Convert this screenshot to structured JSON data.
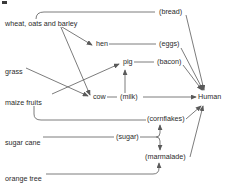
{
  "diagram": {
    "corner_mark": "page-corner-mark",
    "nodes": [
      {
        "id": "wheat",
        "label": "wheat, oats and barley",
        "x": 4,
        "y": 20,
        "kind": "source"
      },
      {
        "id": "grass",
        "label": "grass",
        "x": 4,
        "y": 68,
        "kind": "source"
      },
      {
        "id": "maize",
        "label": "maize fruits",
        "x": 4,
        "y": 99,
        "kind": "source"
      },
      {
        "id": "sugarcane",
        "label": "sugar cane",
        "x": 4,
        "y": 139,
        "kind": "source"
      },
      {
        "id": "orangetree",
        "label": "orange tree",
        "x": 4,
        "y": 175,
        "kind": "source"
      },
      {
        "id": "hen",
        "label": "hen",
        "x": 95,
        "y": 45,
        "kind": "animal"
      },
      {
        "id": "pig",
        "label": "pig",
        "x": 122,
        "y": 63,
        "kind": "animal"
      },
      {
        "id": "cow",
        "label": "cow",
        "x": 92,
        "y": 99,
        "kind": "animal"
      },
      {
        "id": "bread",
        "label": "(bread)",
        "x": 158,
        "y": 14,
        "kind": "product"
      },
      {
        "id": "eggs",
        "label": "(eggs)",
        "x": 158,
        "y": 46,
        "kind": "product"
      },
      {
        "id": "bacon",
        "label": "(bacon)",
        "x": 156,
        "y": 63,
        "kind": "product"
      },
      {
        "id": "milk",
        "label": "(milk)",
        "x": 120,
        "y": 99,
        "kind": "product"
      },
      {
        "id": "cornflakes",
        "label": "(cornflakes)",
        "x": 148,
        "y": 120,
        "kind": "product"
      },
      {
        "id": "sugar",
        "label": "(sugar)",
        "x": 116,
        "y": 139,
        "kind": "product"
      },
      {
        "id": "marmalade",
        "label": "(marmalade)",
        "x": 146,
        "y": 158,
        "kind": "product"
      },
      {
        "id": "human",
        "label": "Human",
        "x": 202,
        "y": 99,
        "kind": "consumer"
      }
    ],
    "edges": [
      {
        "from": "wheat",
        "to": "bread",
        "style": "curve-up",
        "arrow": false
      },
      {
        "from": "wheat",
        "to": "hen",
        "style": "diagonal",
        "arrow": true
      },
      {
        "from": "wheat",
        "to": "cow",
        "style": "diagonal",
        "arrow": true
      },
      {
        "from": "grass",
        "to": "cow",
        "style": "diagonal",
        "arrow": true
      },
      {
        "from": "maize",
        "to": "pig",
        "style": "diagonal",
        "arrow": true
      },
      {
        "from": "maize",
        "to": "cornflakes",
        "style": "curve-down",
        "arrow": false
      },
      {
        "from": "hen",
        "to": "eggs",
        "style": "horizontal",
        "arrow": false
      },
      {
        "from": "pig",
        "to": "bacon",
        "style": "horizontal",
        "arrow": false
      },
      {
        "from": "cow",
        "to": "milk",
        "style": "dash",
        "arrow": false
      },
      {
        "from": "cow",
        "to": "pig",
        "style": "vertical-up",
        "arrow": true
      },
      {
        "from": "bread",
        "to": "human",
        "style": "diagonal",
        "arrow": true
      },
      {
        "from": "eggs",
        "to": "human",
        "style": "diagonal",
        "arrow": true
      },
      {
        "from": "bacon",
        "to": "human",
        "style": "diagonal",
        "arrow": true
      },
      {
        "from": "milk",
        "to": "human",
        "style": "horizontal",
        "arrow": true
      },
      {
        "from": "sugarcane",
        "to": "sugar",
        "style": "horizontal",
        "arrow": false
      },
      {
        "from": "sugar",
        "to": "cornflakes",
        "style": "brace-up",
        "arrow": true
      },
      {
        "from": "sugar",
        "to": "marmalade",
        "style": "brace-down",
        "arrow": true
      },
      {
        "from": "orangetree",
        "to": "marmalade",
        "style": "curve-right",
        "arrow": true
      },
      {
        "from": "cornflakes",
        "to": "human",
        "style": "diagonal",
        "arrow": true
      },
      {
        "from": "marmalade",
        "to": "human",
        "style": "diagonal",
        "arrow": true
      }
    ],
    "colors": {
      "line": "#5a5a5a",
      "text": "#2b2b2b",
      "background": "#ffffff"
    }
  }
}
